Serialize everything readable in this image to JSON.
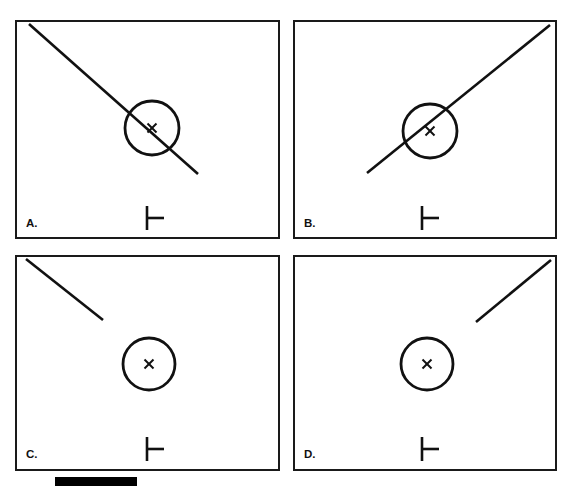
{
  "figure": {
    "background_color": "#ffffff",
    "ink_color": "#111111",
    "width": 571,
    "height": 488,
    "layout": "2x2 panel grid"
  },
  "panels": [
    {
      "id": "panel-a",
      "label": "A.",
      "frame": {
        "x": 16,
        "y": 21,
        "w": 263,
        "h": 217
      },
      "label_pos": {
        "x": 26,
        "y": 227
      },
      "circle": {
        "cx": 152,
        "cy": 128,
        "r": 27
      },
      "x_marker": {
        "cx": 152,
        "cy": 128,
        "size": 9
      },
      "tick_glyph": {
        "x": 147,
        "y": 206,
        "height": 24,
        "arm": 17
      },
      "line": {
        "x1": 29,
        "y1": 24,
        "x2": 198,
        "y2": 174,
        "description": "long descending diagonal from top-left corner through circle"
      }
    },
    {
      "id": "panel-b",
      "label": "B.",
      "frame": {
        "x": 294,
        "y": 21,
        "w": 262,
        "h": 217
      },
      "label_pos": {
        "x": 304,
        "y": 227
      },
      "circle": {
        "cx": 430,
        "cy": 131,
        "r": 27
      },
      "x_marker": {
        "cx": 430,
        "cy": 131,
        "size": 9
      },
      "tick_glyph": {
        "x": 422,
        "y": 206,
        "height": 24,
        "arm": 17
      },
      "line": {
        "x1": 367,
        "y1": 173,
        "x2": 550,
        "y2": 25,
        "description": "long ascending diagonal from lower-left through circle to top-right corner"
      }
    },
    {
      "id": "panel-c",
      "label": "C.",
      "frame": {
        "x": 16,
        "y": 256,
        "w": 263,
        "h": 214
      },
      "label_pos": {
        "x": 26,
        "y": 458
      },
      "circle": {
        "cx": 149,
        "cy": 364,
        "r": 26
      },
      "x_marker": {
        "cx": 149,
        "cy": 364,
        "size": 9
      },
      "tick_glyph": {
        "x": 147,
        "y": 437,
        "height": 24,
        "arm": 17
      },
      "line": {
        "x1": 26,
        "y1": 259,
        "x2": 103,
        "y2": 320,
        "description": "short descending diagonal from top-left corner, stops before circle"
      }
    },
    {
      "id": "panel-d",
      "label": "D.",
      "frame": {
        "x": 294,
        "y": 256,
        "w": 262,
        "h": 214
      },
      "label_pos": {
        "x": 304,
        "y": 458
      },
      "circle": {
        "cx": 427,
        "cy": 364,
        "r": 26
      },
      "x_marker": {
        "cx": 427,
        "cy": 364,
        "size": 9
      },
      "tick_glyph": {
        "x": 422,
        "y": 437,
        "height": 24,
        "arm": 17
      },
      "line": {
        "x1": 476,
        "y1": 322,
        "x2": 551,
        "y2": 260,
        "description": "short ascending diagonal ending at top-right corner, stops above circle"
      }
    }
  ],
  "scale_bar": {
    "name": "scale-bar",
    "x": 55,
    "y": 477,
    "width": 82,
    "height": 9,
    "color": "#000000"
  },
  "glyph_names": {
    "circle": "target-circle",
    "x_mark": "x-mark-icon",
    "tick": "tick-glyph-icon",
    "diagonal": "diagonal-line"
  }
}
